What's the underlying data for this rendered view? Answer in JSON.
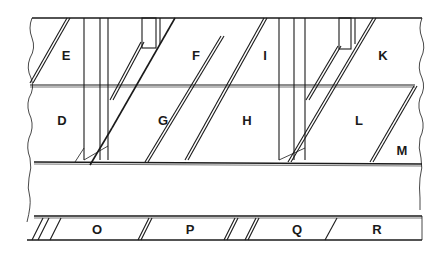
{
  "diagram": {
    "type": "line-drawing",
    "colors": {
      "line": "#1a1a1a",
      "background": "#ffffff"
    },
    "labels": [
      {
        "id": "E",
        "text": "E",
        "x": 66,
        "y": 55
      },
      {
        "id": "F",
        "text": "F",
        "x": 196,
        "y": 55
      },
      {
        "id": "I",
        "text": "I",
        "x": 265,
        "y": 55
      },
      {
        "id": "K",
        "text": "K",
        "x": 383,
        "y": 55
      },
      {
        "id": "D",
        "text": "D",
        "x": 62,
        "y": 120
      },
      {
        "id": "G",
        "text": "G",
        "x": 163,
        "y": 120
      },
      {
        "id": "H",
        "text": "H",
        "x": 247,
        "y": 120
      },
      {
        "id": "L",
        "text": "L",
        "x": 359,
        "y": 120
      },
      {
        "id": "M",
        "text": "M",
        "x": 402,
        "y": 150
      },
      {
        "id": "O",
        "text": "O",
        "x": 97,
        "y": 229
      },
      {
        "id": "P",
        "text": "P",
        "x": 190,
        "y": 229
      },
      {
        "id": "Q",
        "text": "Q",
        "x": 297,
        "y": 229
      },
      {
        "id": "R",
        "text": "R",
        "x": 377,
        "y": 229
      }
    ]
  }
}
